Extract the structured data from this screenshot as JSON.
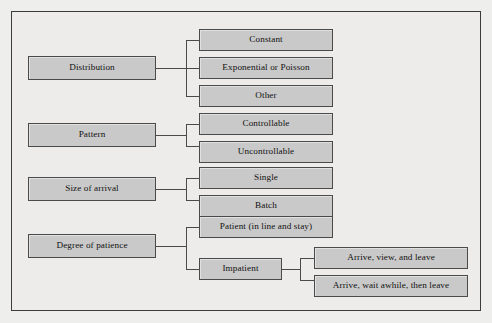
{
  "figure": {
    "title": "",
    "background_color": "#edecea",
    "node_fill": "#c9c9c9",
    "node_border": "#4a4a4a",
    "frame_border": "#3b3b3b"
  },
  "diagram": {
    "type": "tree",
    "orientation": "left-to-right",
    "branches": [
      {
        "id": "distribution",
        "label": "Distribution",
        "children": [
          {
            "id": "constant",
            "label": "Constant"
          },
          {
            "id": "exponential-or-poisson",
            "label": "Exponential or Poisson"
          },
          {
            "id": "other",
            "label": "Other"
          }
        ]
      },
      {
        "id": "pattern",
        "label": "Pattern",
        "children": [
          {
            "id": "controllable",
            "label": "Controllable"
          },
          {
            "id": "uncontrollable",
            "label": "Uncontrollable"
          }
        ]
      },
      {
        "id": "size-of-arrival",
        "label": "Size of arrival",
        "children": [
          {
            "id": "single",
            "label": "Single"
          },
          {
            "id": "batch",
            "label": "Batch"
          }
        ]
      },
      {
        "id": "degree-of-patience",
        "label": "Degree of patience",
        "children": [
          {
            "id": "patient",
            "label": "Patient (in line and stay)"
          },
          {
            "id": "impatient",
            "label": "Impatient",
            "children": [
              {
                "id": "arrive-view-and-leave",
                "label": "Arrive, view, and leave"
              },
              {
                "id": "arrive-wait-awhile-then-leave",
                "label": "Arrive, wait awhile, then leave"
              }
            ]
          }
        ]
      }
    ]
  }
}
